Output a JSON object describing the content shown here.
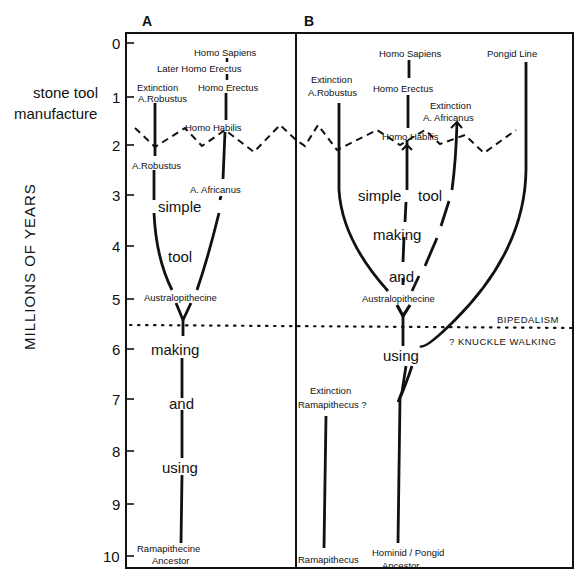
{
  "figure": {
    "y_axis_label": "MILLIONS OF YEARS",
    "y_ticks": [
      "0",
      "1",
      "2",
      "3",
      "4",
      "5",
      "6",
      "7",
      "8",
      "9",
      "10"
    ],
    "side_annotation": [
      "stone tool",
      "manufacture"
    ],
    "colors": {
      "ink": "#111111",
      "background": "#ffffff"
    }
  },
  "panel_a": {
    "letter": "A",
    "labels": {
      "homo_sapiens": "Homo Sapiens",
      "later_homo_erectus": "Later Homo Erectus",
      "extinction": "Extinction",
      "a_robustus_extinct": "A.Robustus",
      "homo_erectus": "Homo Erectus",
      "homo_habilis": "Homo Habilis",
      "a_robustus": "A.Robustus",
      "a_africanus": "A. Africanus",
      "australopithecine": "Australopithecine",
      "ancestor_line1": "Ramapithecine",
      "ancestor_line2": "Ancestor"
    },
    "phrase": [
      "simple",
      "tool",
      "making",
      "and",
      "using"
    ]
  },
  "panel_b": {
    "letter": "B",
    "labels": {
      "homo_sapiens": "Homo Sapiens",
      "pongid_line": "Pongid Line",
      "extinction_robustus": "Extinction",
      "a_robustus": "A.Robustus",
      "homo_erectus": "Homo Erectus",
      "extinction_africanus": "Extinction",
      "a_africanus": "A. Africanus",
      "homo_habilis": "Homo Habilis",
      "australopithecine": "Australopithecine",
      "bipedalism": "BIPEDALISM",
      "knuckle_walking": "? KNUCKLE WALKING",
      "extinction_ramapithecus": "Extinction",
      "ramapithecus_q": "Ramapithecus ?",
      "ramapithecus": "Ramapithecus",
      "hp_ancestor_line1": "Hominid / Pongid",
      "hp_ancestor_line2": "Ancestor"
    },
    "phrase": [
      "simple",
      "tool",
      "making",
      "and",
      "using"
    ]
  }
}
